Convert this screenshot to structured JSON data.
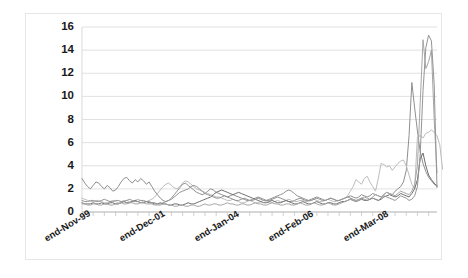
{
  "chart_data": {
    "type": "line",
    "title": "",
    "xlabel": "",
    "ylabel": "",
    "ylim": [
      0,
      16
    ],
    "yticks": [
      0,
      2,
      4,
      6,
      8,
      10,
      12,
      14,
      16
    ],
    "ytick_labels": [
      "0",
      "2",
      "4",
      "6",
      "8",
      "10",
      "12",
      "14",
      "16"
    ],
    "grid": true,
    "grid_axis": "y",
    "legend": "none",
    "xtick_labels": [
      "end-Nov-99",
      "end-Dec-01",
      "end-Jan-04",
      "end-Feb-06",
      "end-Mar-08"
    ],
    "xtick_positions_frac": [
      0.035,
      0.245,
      0.455,
      0.665,
      0.875
    ],
    "xtick_rotation_deg": -31,
    "n_points": 128,
    "x_index_range": [
      0,
      127
    ],
    "colors": {
      "series_1": "#8f8f8f",
      "series_2": "#bcbcbc",
      "series_3": "#6e6e6e",
      "series_4": "#a6a6a6",
      "series_5": "#949494",
      "gridline": "#d9d9d9",
      "axis": "#bdbdbd",
      "frame_border": "#e6e6e6",
      "background": "#ffffff",
      "tick_text": "#1a1a1a"
    },
    "series": [
      {
        "name": "series_1",
        "color": "#8f8f8f",
        "values": [
          2.9,
          2.5,
          2.2,
          2.0,
          2.3,
          2.6,
          2.5,
          2.2,
          2.0,
          2.3,
          2.1,
          1.8,
          1.9,
          2.2,
          2.6,
          2.9,
          3.0,
          2.7,
          2.5,
          2.8,
          2.6,
          2.9,
          2.7,
          2.4,
          2.6,
          2.2,
          1.8,
          1.5,
          1.2,
          1.0,
          0.9,
          1.0,
          1.2,
          1.5,
          1.8,
          2.1,
          2.4,
          2.5,
          2.3,
          2.1,
          1.9,
          1.7,
          1.6,
          1.5,
          1.6,
          1.8,
          2.0,
          1.9,
          1.7,
          1.6,
          1.5,
          1.4,
          1.3,
          1.4,
          1.5,
          1.4,
          1.3,
          1.2,
          1.1,
          1.0,
          1.0,
          1.1,
          1.2,
          1.3,
          1.2,
          1.1,
          1.0,
          1.0,
          1.1,
          1.2,
          1.3,
          1.2,
          1.1,
          1.0,
          0.9,
          0.9,
          1.0,
          1.1,
          1.2,
          1.1,
          1.0,
          1.0,
          1.1,
          1.2,
          1.3,
          1.2,
          1.1,
          1.0,
          1.1,
          1.2,
          1.1,
          1.0,
          1.0,
          1.1,
          1.2,
          1.3,
          1.4,
          1.3,
          1.2,
          1.3,
          1.5,
          1.4,
          1.3,
          1.4,
          1.6,
          1.5,
          1.4,
          1.3,
          1.5,
          1.7,
          1.6,
          1.5,
          1.8,
          2.0,
          2.2,
          2.6,
          3.6,
          6.6,
          11.2,
          9.0,
          7.0,
          5.2,
          4.2,
          3.5,
          3.0,
          2.7,
          2.4,
          2.3
        ]
      },
      {
        "name": "series_2",
        "color": "#bcbcbc",
        "values": [
          1.2,
          1.1,
          1.0,
          0.9,
          0.9,
          1.0,
          1.0,
          0.9,
          0.8,
          0.8,
          0.9,
          1.0,
          0.9,
          0.8,
          0.9,
          1.0,
          1.0,
          0.9,
          0.9,
          1.0,
          1.1,
          1.0,
          0.9,
          0.9,
          1.0,
          1.1,
          1.3,
          1.6,
          1.9,
          2.2,
          2.4,
          2.5,
          2.3,
          2.1,
          2.0,
          2.2,
          2.5,
          2.7,
          2.6,
          2.4,
          2.2,
          2.0,
          1.9,
          1.8,
          1.7,
          1.6,
          1.5,
          1.4,
          1.3,
          1.3,
          1.2,
          1.1,
          1.0,
          1.0,
          1.1,
          1.0,
          0.9,
          0.8,
          0.8,
          0.9,
          1.0,
          0.9,
          0.8,
          0.8,
          0.9,
          1.0,
          0.9,
          0.8,
          0.8,
          0.9,
          1.0,
          0.9,
          0.9,
          1.0,
          1.1,
          1.0,
          0.9,
          0.9,
          1.0,
          1.0,
          0.9,
          0.9,
          1.0,
          1.1,
          1.0,
          0.9,
          0.9,
          1.0,
          1.1,
          1.0,
          0.9,
          0.9,
          1.0,
          1.1,
          1.2,
          1.4,
          1.8,
          2.2,
          2.8,
          2.6,
          2.4,
          2.9,
          3.1,
          2.6,
          2.2,
          1.8,
          2.9,
          4.2,
          4.1,
          3.9,
          4.0,
          3.6,
          3.9,
          4.2,
          4.4,
          4.5,
          4.0,
          3.2,
          2.4,
          2.0,
          6.5,
          6.6,
          6.4,
          6.8,
          6.9,
          7.1,
          6.9,
          6.6,
          5.8,
          3.7
        ]
      },
      {
        "name": "series_3",
        "color": "#6e6e6e",
        "values": [
          0.8,
          0.7,
          0.7,
          0.7,
          0.8,
          0.7,
          0.7,
          0.8,
          0.7,
          0.7,
          0.8,
          0.8,
          0.7,
          0.7,
          0.8,
          0.9,
          0.8,
          0.8,
          0.9,
          1.0,
          0.9,
          0.8,
          0.8,
          0.9,
          0.8,
          0.8,
          0.7,
          0.7,
          0.8,
          0.7,
          0.7,
          0.6,
          0.6,
          0.7,
          0.7,
          0.6,
          0.6,
          0.7,
          0.8,
          0.7,
          0.7,
          0.8,
          0.9,
          1.0,
          1.1,
          1.2,
          1.3,
          1.5,
          1.7,
          1.8,
          1.9,
          1.8,
          1.7,
          1.6,
          1.5,
          1.6,
          1.7,
          1.6,
          1.5,
          1.4,
          1.3,
          1.2,
          1.1,
          1.0,
          0.9,
          0.8,
          0.8,
          0.9,
          1.0,
          0.9,
          0.8,
          0.8,
          0.9,
          1.0,
          0.9,
          0.8,
          0.7,
          0.7,
          0.8,
          0.9,
          0.8,
          0.7,
          0.7,
          0.8,
          0.9,
          0.8,
          0.7,
          0.7,
          0.8,
          0.8,
          0.7,
          0.7,
          0.8,
          0.9,
          0.9,
          1.0,
          1.1,
          1.0,
          0.9,
          1.0,
          1.1,
          1.0,
          1.0,
          1.1,
          1.2,
          1.1,
          1.0,
          1.1,
          1.3,
          1.4,
          1.5,
          1.4,
          1.3,
          1.4,
          1.6,
          1.5,
          1.4,
          1.3,
          1.6,
          2.0,
          2.8,
          4.6,
          5.1,
          4.0,
          3.2,
          2.8,
          2.5,
          2.2
        ]
      },
      {
        "name": "series_4",
        "color": "#a6a6a6",
        "values": [
          0.7,
          0.7,
          0.6,
          0.6,
          0.7,
          0.7,
          0.6,
          0.6,
          0.7,
          0.7,
          0.6,
          0.6,
          0.7,
          0.7,
          0.8,
          0.7,
          0.7,
          0.8,
          0.8,
          0.7,
          0.7,
          0.8,
          0.8,
          0.7,
          0.7,
          0.7,
          0.6,
          0.6,
          0.6,
          0.7,
          0.7,
          0.6,
          0.6,
          0.5,
          0.5,
          0.6,
          0.6,
          0.5,
          0.5,
          0.6,
          0.6,
          0.5,
          0.5,
          0.6,
          0.7,
          0.6,
          0.6,
          0.7,
          0.7,
          0.6,
          0.6,
          0.7,
          0.8,
          0.7,
          0.7,
          0.6,
          0.6,
          0.7,
          0.7,
          0.6,
          0.6,
          0.7,
          0.8,
          0.7,
          0.7,
          0.6,
          0.6,
          0.7,
          0.8,
          0.7,
          0.7,
          0.6,
          0.6,
          0.7,
          0.7,
          0.6,
          0.6,
          0.7,
          0.8,
          0.7,
          0.6,
          0.6,
          0.7,
          0.8,
          0.7,
          0.6,
          0.6,
          0.7,
          0.8,
          0.7,
          0.6,
          0.6,
          0.7,
          0.8,
          0.9,
          1.0,
          1.1,
          1.0,
          0.9,
          1.0,
          1.2,
          1.3,
          1.2,
          1.1,
          1.3,
          1.5,
          1.4,
          1.3,
          1.5,
          1.7,
          1.6,
          1.5,
          1.4,
          1.6,
          1.8,
          1.7,
          1.6,
          1.5,
          1.8,
          2.4,
          4.0,
          9.5,
          14.9,
          12.4,
          13.0,
          14.0,
          8.0,
          3.4
        ]
      },
      {
        "name": "series_5",
        "color": "#949494",
        "values": [
          1.0,
          0.9,
          0.9,
          1.0,
          1.0,
          0.9,
          0.9,
          1.0,
          1.1,
          1.0,
          0.9,
          0.9,
          1.0,
          1.0,
          0.9,
          0.9,
          1.0,
          1.1,
          1.0,
          0.9,
          0.9,
          1.0,
          1.0,
          0.9,
          0.9,
          0.8,
          0.8,
          0.7,
          0.7,
          0.8,
          0.9,
          1.0,
          1.1,
          1.3,
          1.5,
          1.7,
          1.8,
          1.9,
          2.0,
          2.2,
          2.3,
          2.2,
          2.0,
          1.8,
          1.6,
          1.5,
          1.4,
          1.3,
          1.2,
          1.2,
          1.3,
          1.4,
          1.3,
          1.2,
          1.1,
          1.0,
          1.0,
          1.1,
          1.2,
          1.1,
          1.0,
          1.0,
          1.1,
          1.2,
          1.1,
          1.0,
          1.0,
          1.1,
          1.2,
          1.3,
          1.4,
          1.5,
          1.6,
          1.8,
          1.9,
          1.8,
          1.6,
          1.4,
          1.3,
          1.2,
          1.1,
          1.0,
          1.0,
          1.1,
          1.2,
          1.1,
          1.0,
          1.0,
          1.1,
          1.2,
          1.1,
          1.0,
          1.0,
          1.1,
          1.2,
          1.3,
          1.2,
          1.1,
          1.0,
          1.1,
          1.2,
          1.1,
          1.0,
          1.1,
          1.2,
          1.1,
          1.0,
          1.2,
          1.4,
          1.3,
          1.2,
          1.1,
          1.0,
          1.2,
          1.4,
          1.3,
          1.2,
          1.0,
          1.1,
          1.4,
          2.2,
          5.0,
          10.5,
          14.2,
          15.3,
          14.8,
          11.0,
          2.1
        ]
      }
    ]
  }
}
